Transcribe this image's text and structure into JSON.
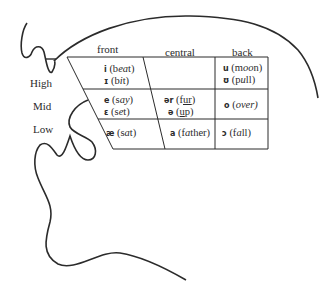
{
  "diagram": {
    "type": "vowel-chart-with-head-profile",
    "columns": [
      "front",
      "central",
      "back"
    ],
    "rows": [
      "High",
      "Mid",
      "Low"
    ],
    "cells": {
      "high_front": [
        {
          "symbol": "i",
          "word_pre": "(b",
          "word_em": "ea",
          "word_post": "t)"
        },
        {
          "symbol": "ɪ",
          "word_pre": "(b",
          "word_em": "i",
          "word_post": "t)"
        }
      ],
      "high_back": [
        {
          "symbol": "u",
          "word_pre": "(m",
          "word_em": "oo",
          "word_post": "n)"
        },
        {
          "symbol": "ʊ",
          "word_pre": "(p",
          "word_em": "u",
          "word_post": "ll)"
        }
      ],
      "mid_front": [
        {
          "symbol": "e",
          "word_pre": "(s",
          "word_em": "ay",
          "word_post": ")"
        },
        {
          "symbol": "ɛ",
          "word_pre": "(s",
          "word_em": "e",
          "word_post": "t)"
        }
      ],
      "mid_central": [
        {
          "symbol": "ər",
          "word_pre": "(f",
          "word_em": "ur",
          "word_post": ")"
        },
        {
          "symbol": "ə",
          "word_pre": "(",
          "word_em": "u",
          "word_post": "p)"
        }
      ],
      "mid_back": [
        {
          "symbol": "o",
          "word_pre": "(",
          "word_em": "o",
          "word_post": "ver)"
        }
      ],
      "low_front": [
        {
          "symbol": "æ",
          "word_pre": "(s",
          "word_em": "a",
          "word_post": "t)"
        }
      ],
      "low_central": [
        {
          "symbol": "a",
          "word_pre": "(f",
          "word_em": "a",
          "word_post": "ther)"
        }
      ],
      "low_back": [
        {
          "symbol": "ɔ",
          "word_pre": "(f",
          "word_em": "a",
          "word_post": "ll)"
        }
      ]
    },
    "line_color": "#2b2b2b",
    "text_color": "#2b2b2b"
  }
}
